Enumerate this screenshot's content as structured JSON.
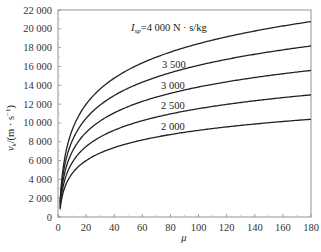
{
  "chart_data": {
    "type": "line",
    "title": "",
    "xlabel": "μ",
    "ylabel": "v_k/(m · s^-1)",
    "xlim": [
      0,
      180
    ],
    "ylim": [
      0,
      22000
    ],
    "x_ticks": [
      0,
      20,
      40,
      60,
      80,
      100,
      120,
      140,
      160,
      180
    ],
    "x_tick_labels": [
      "0",
      "20",
      "40",
      "60",
      "80",
      "100",
      "120",
      "140",
      "160",
      "180"
    ],
    "y_ticks": [
      0,
      2000,
      4000,
      6000,
      8000,
      10000,
      12000,
      14000,
      16000,
      18000,
      20000,
      22000
    ],
    "y_tick_labels": [
      "0",
      "2 000",
      "4 000",
      "6 000",
      "8 000",
      "10 000",
      "12 000",
      "14 000",
      "16 000",
      "18 000",
      "20 000",
      "22 000"
    ],
    "grid": false,
    "legend": "inline labels",
    "x": [
      2,
      5,
      10,
      20,
      40,
      60,
      80,
      100,
      120,
      140,
      160,
      180
    ],
    "series": [
      {
        "name": "I_sp=4 000 N · s/kg",
        "label": "I_sp=4 000 N · s/kg",
        "values": [
          2773,
          6438,
          9210,
          11983,
          14756,
          16377,
          17528,
          18421,
          19150,
          19767,
          20301,
          20772
        ]
      },
      {
        "name": "3 500",
        "label": "3 500",
        "values": [
          2426,
          5633,
          8059,
          10485,
          12911,
          14330,
          15337,
          16118,
          16756,
          17296,
          17764,
          18175
        ]
      },
      {
        "name": "3 000",
        "label": "3 000",
        "values": [
          2079,
          4828,
          6908,
          8987,
          11067,
          12283,
          13146,
          13816,
          14363,
          14825,
          15226,
          15579
        ]
      },
      {
        "name": "2 500",
        "label": "2 500",
        "values": [
          1733,
          4024,
          5756,
          7489,
          9222,
          10236,
          10955,
          11513,
          11969,
          12354,
          12688,
          12983
        ]
      },
      {
        "name": "2 000",
        "label": "2 000",
        "values": [
          1386,
          3219,
          4605,
          5991,
          7378,
          8189,
          8764,
          9210,
          9575,
          9883,
          10150,
          10386
        ]
      }
    ],
    "annotations": [
      {
        "text": "I_sp=4 000 N · s/kg",
        "x": 55,
        "y": 19600
      },
      {
        "text": "3 500",
        "x": 78,
        "y": 14900
      },
      {
        "text": "3 000",
        "x": 78,
        "y": 12400
      },
      {
        "text": "2 500",
        "x": 78,
        "y": 10000
      },
      {
        "text": "2 000",
        "x": 78,
        "y": 7600
      }
    ]
  },
  "labels": {
    "ylabel_main": "v",
    "ylabel_sub": "k",
    "ylabel_unit": "/(m · s",
    "ylabel_exp": "−1",
    "ylabel_close": ")",
    "xlabel": "μ",
    "isp_main": "I",
    "isp_sub": "sp",
    "isp_rest": "=4 000 N · s/kg",
    "curve_3500": "3 500",
    "curve_3000": "3 000",
    "curve_2500": "2 500",
    "curve_2000": "2 000"
  }
}
